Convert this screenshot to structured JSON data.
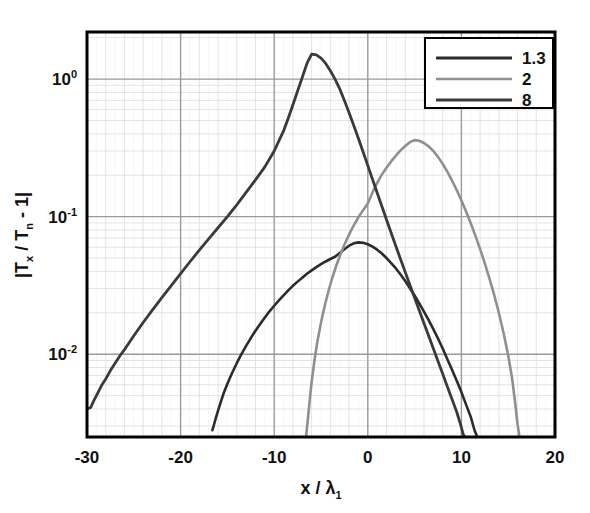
{
  "chart_data": {
    "type": "line",
    "title": "",
    "xlabel": "x / λ₁",
    "ylabel": "|Tₓ / Tₙ - 1|",
    "xlim": [
      -30,
      20
    ],
    "ylim": [
      0.0025,
      2.2
    ],
    "yscale": "log",
    "xscale": "linear",
    "grid": true,
    "grid_minor": true,
    "xticks": [
      -30,
      -20,
      -10,
      0,
      10,
      20
    ],
    "xtick_labels": [
      "-30",
      "-20",
      "-10",
      "0",
      "10",
      "20"
    ],
    "yticks": [
      1,
      0.1,
      0.01
    ],
    "ytick_labels": [
      "10⁰",
      "10⁻¹",
      "10⁻²"
    ],
    "legend_position": "top-right",
    "legend_entries": [
      "1.3",
      "2",
      "8"
    ],
    "series": [
      {
        "name": "1.3",
        "color": "#2b2b2b",
        "width": 2.6,
        "peak_x": -1.0,
        "peak_y": 0.065,
        "points": [
          [
            -16.6,
            0.0028
          ],
          [
            -16.2,
            0.0035
          ],
          [
            -15.8,
            0.0043
          ],
          [
            -15.4,
            0.0052
          ],
          [
            -15.0,
            0.0061
          ],
          [
            -14.5,
            0.0073
          ],
          [
            -14.0,
            0.0086
          ],
          [
            -13.5,
            0.01
          ],
          [
            -13.0,
            0.0115
          ],
          [
            -12.5,
            0.0131
          ],
          [
            -12.0,
            0.0148
          ],
          [
            -11.5,
            0.0166
          ],
          [
            -11.0,
            0.0185
          ],
          [
            -10.5,
            0.0205
          ],
          [
            -10.0,
            0.0225
          ],
          [
            -9.5,
            0.0246
          ],
          [
            -9.0,
            0.0268
          ],
          [
            -8.5,
            0.0291
          ],
          [
            -8.0,
            0.0314
          ],
          [
            -7.5,
            0.0337
          ],
          [
            -7.0,
            0.036
          ],
          [
            -6.5,
            0.0384
          ],
          [
            -6.0,
            0.0407
          ],
          [
            -5.5,
            0.0429
          ],
          [
            -5.0,
            0.0451
          ],
          [
            -4.5,
            0.0472
          ],
          [
            -4.0,
            0.0492
          ],
          [
            -3.5,
            0.0511
          ],
          [
            -3.0,
            0.0545
          ],
          [
            -2.5,
            0.058
          ],
          [
            -2.0,
            0.0615
          ],
          [
            -1.5,
            0.064
          ],
          [
            -1.0,
            0.065
          ],
          [
            -0.5,
            0.0645
          ],
          [
            0.0,
            0.063
          ],
          [
            0.5,
            0.0605
          ],
          [
            1.0,
            0.0575
          ],
          [
            1.5,
            0.054
          ],
          [
            2.0,
            0.05
          ],
          [
            2.5,
            0.046
          ],
          [
            3.0,
            0.042
          ],
          [
            3.5,
            0.038
          ],
          [
            4.0,
            0.034
          ],
          [
            4.5,
            0.0302
          ],
          [
            5.0,
            0.0267
          ],
          [
            5.5,
            0.0234
          ],
          [
            6.0,
            0.0204
          ],
          [
            6.5,
            0.0177
          ],
          [
            7.0,
            0.0152
          ],
          [
            7.5,
            0.013
          ],
          [
            8.0,
            0.011
          ],
          [
            8.5,
            0.0092
          ],
          [
            9.0,
            0.0077
          ],
          [
            9.5,
            0.0064
          ],
          [
            10.0,
            0.0053
          ],
          [
            10.5,
            0.0043
          ],
          [
            11.0,
            0.0035
          ],
          [
            11.4,
            0.0028
          ],
          [
            11.7,
            0.0025
          ]
        ]
      },
      {
        "name": "2",
        "color": "#8f8f8f",
        "width": 2.6,
        "peak_x": 5.0,
        "peak_y": 0.36,
        "points": [
          [
            -6.6,
            0.0025
          ],
          [
            -6.4,
            0.0034
          ],
          [
            -6.2,
            0.0047
          ],
          [
            -6.0,
            0.0063
          ],
          [
            -5.7,
            0.009
          ],
          [
            -5.4,
            0.0122
          ],
          [
            -5.0,
            0.017
          ],
          [
            -4.6,
            0.0225
          ],
          [
            -4.2,
            0.0288
          ],
          [
            -3.8,
            0.0358
          ],
          [
            -3.4,
            0.0434
          ],
          [
            -3.0,
            0.0515
          ],
          [
            -2.5,
            0.0625
          ],
          [
            -2.0,
            0.0742
          ],
          [
            -1.5,
            0.0864
          ],
          [
            -1.0,
            0.099
          ],
          [
            -0.5,
            0.1115
          ],
          [
            0.0,
            0.1245
          ],
          [
            0.5,
            0.15
          ],
          [
            1.0,
            0.176
          ],
          [
            1.5,
            0.202
          ],
          [
            2.0,
            0.227
          ],
          [
            2.5,
            0.252
          ],
          [
            3.0,
            0.278
          ],
          [
            3.5,
            0.303
          ],
          [
            4.0,
            0.326
          ],
          [
            4.5,
            0.348
          ],
          [
            5.0,
            0.36
          ],
          [
            5.5,
            0.356
          ],
          [
            6.0,
            0.343
          ],
          [
            6.5,
            0.324
          ],
          [
            7.0,
            0.3
          ],
          [
            7.5,
            0.272
          ],
          [
            8.0,
            0.242
          ],
          [
            8.5,
            0.212
          ],
          [
            9.0,
            0.183
          ],
          [
            9.5,
            0.156
          ],
          [
            10.0,
            0.131
          ],
          [
            10.5,
            0.109
          ],
          [
            11.0,
            0.0895
          ],
          [
            11.5,
            0.0725
          ],
          [
            12.0,
            0.058
          ],
          [
            12.5,
            0.0458
          ],
          [
            13.0,
            0.0355
          ],
          [
            13.5,
            0.027
          ],
          [
            14.0,
            0.02
          ],
          [
            14.5,
            0.0143
          ],
          [
            15.0,
            0.0098
          ],
          [
            15.4,
            0.0068
          ],
          [
            15.7,
            0.0047
          ],
          [
            16.0,
            0.0031
          ],
          [
            16.2,
            0.0025
          ]
        ]
      },
      {
        "name": "8",
        "color": "#3a3a3a",
        "width": 2.8,
        "peak_x": -6.0,
        "peak_y": 1.52,
        "points": [
          [
            -30.0,
            0.004
          ],
          [
            -29.6,
            0.0041
          ],
          [
            -29.2,
            0.0047
          ],
          [
            -28.8,
            0.0053
          ],
          [
            -28.4,
            0.006
          ],
          [
            -28.0,
            0.0066
          ],
          [
            -27.5,
            0.0076
          ],
          [
            -27.0,
            0.0086
          ],
          [
            -26.5,
            0.0097
          ],
          [
            -26.0,
            0.0108
          ],
          [
            -25.5,
            0.0121
          ],
          [
            -25.0,
            0.0136
          ],
          [
            -24.0,
            0.017
          ],
          [
            -23.0,
            0.021
          ],
          [
            -22.0,
            0.0258
          ],
          [
            -21.0,
            0.0315
          ],
          [
            -20.0,
            0.0385
          ],
          [
            -19.0,
            0.047
          ],
          [
            -18.0,
            0.057
          ],
          [
            -17.0,
            0.069
          ],
          [
            -16.0,
            0.083
          ],
          [
            -15.0,
            0.1
          ],
          [
            -14.0,
            0.122
          ],
          [
            -13.0,
            0.15
          ],
          [
            -12.0,
            0.185
          ],
          [
            -11.0,
            0.23
          ],
          [
            -10.0,
            0.3
          ],
          [
            -9.5,
            0.355
          ],
          [
            -9.0,
            0.42
          ],
          [
            -8.5,
            0.52
          ],
          [
            -8.0,
            0.65
          ],
          [
            -7.5,
            0.82
          ],
          [
            -7.0,
            1.03
          ],
          [
            -6.5,
            1.3
          ],
          [
            -6.0,
            1.52
          ],
          [
            -5.5,
            1.5
          ],
          [
            -5.0,
            1.42
          ],
          [
            -4.5,
            1.3
          ],
          [
            -4.0,
            1.15
          ],
          [
            -3.5,
            1.0
          ],
          [
            -3.0,
            0.85
          ],
          [
            -2.5,
            0.7
          ],
          [
            -2.0,
            0.57
          ],
          [
            -1.5,
            0.46
          ],
          [
            -1.0,
            0.37
          ],
          [
            -0.5,
            0.295
          ],
          [
            0.0,
            0.235
          ],
          [
            0.5,
            0.187
          ],
          [
            1.0,
            0.149
          ],
          [
            1.5,
            0.119
          ],
          [
            2.0,
            0.095
          ],
          [
            2.5,
            0.076
          ],
          [
            3.0,
            0.061
          ],
          [
            3.5,
            0.049
          ],
          [
            4.0,
            0.0395
          ],
          [
            4.5,
            0.0318
          ],
          [
            5.0,
            0.0257
          ],
          [
            5.5,
            0.0208
          ],
          [
            6.0,
            0.0168
          ],
          [
            6.5,
            0.0136
          ],
          [
            7.0,
            0.011
          ],
          [
            7.5,
            0.0089
          ],
          [
            8.0,
            0.0072
          ],
          [
            8.5,
            0.0058
          ],
          [
            9.0,
            0.0047
          ],
          [
            9.5,
            0.0038
          ],
          [
            9.9,
            0.0031
          ],
          [
            10.2,
            0.0026
          ],
          [
            10.4,
            0.0025
          ]
        ]
      }
    ]
  },
  "axes": {
    "x_tick_labels": [
      "-30",
      "-20",
      "-10",
      "0",
      "10",
      "20"
    ],
    "y_tick_main": [
      "10",
      "10",
      "10"
    ],
    "y_tick_exp": [
      "0",
      "-1",
      "-2"
    ],
    "x_title_main": "x / ",
    "x_title_lambda": "λ",
    "x_title_sub": "1",
    "y_title_part1": "|T",
    "y_title_sub1": "x",
    "y_title_part2": " / T",
    "y_title_sub2": "n",
    "y_title_part3": " - 1|"
  },
  "legend": {
    "items": [
      {
        "label": "1.3",
        "color": "#2b2b2b",
        "width": 3.0
      },
      {
        "label": "2",
        "color": "#8f8f8f",
        "width": 2.6
      },
      {
        "label": "8",
        "color": "#3a3a3a",
        "width": 3.0
      }
    ]
  },
  "style": {
    "background": "#ffffff",
    "plot_background": "#ffffff",
    "axis_color": "#000000",
    "major_grid_color": "#9a9a9a",
    "minor_grid_color": "#d8d8d8"
  }
}
